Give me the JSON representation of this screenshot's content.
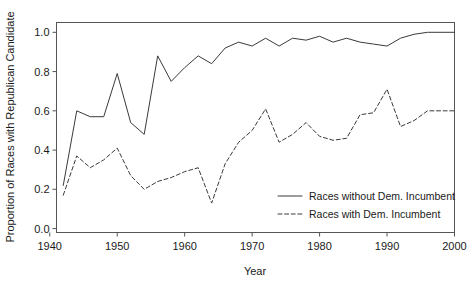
{
  "chart_data": {
    "type": "line",
    "title": "",
    "subtitle": "",
    "xlabel": "Year",
    "ylabel": "Proportion of Races with Republican Candidate",
    "xlim": [
      1941,
      2000
    ],
    "ylim": [
      -0.02,
      1.05
    ],
    "grid": false,
    "legend_position": "bottom-right",
    "xticks": [
      1940,
      1950,
      1960,
      1970,
      1980,
      1990,
      2000
    ],
    "xticklabels": [
      "1940",
      "1950",
      "1960",
      "1970",
      "1980",
      "1990",
      "2000"
    ],
    "yticks": [
      0.0,
      0.2,
      0.4,
      0.6,
      0.8,
      1.0
    ],
    "yticklabels": [
      "0.0",
      "0.2",
      "0.4",
      "0.6",
      "0.8",
      "1.0"
    ],
    "x": [
      1942,
      1944,
      1946,
      1948,
      1950,
      1952,
      1954,
      1956,
      1958,
      1960,
      1962,
      1964,
      1966,
      1968,
      1970,
      1972,
      1974,
      1976,
      1978,
      1980,
      1982,
      1984,
      1986,
      1988,
      1990,
      1992,
      1994,
      1996,
      1998,
      2000
    ],
    "series": [
      {
        "name": "Races without Dem. Incumbent",
        "style": "solid",
        "color": "#3a3a3a",
        "values": [
          0.22,
          0.6,
          0.57,
          0.57,
          0.79,
          0.54,
          0.48,
          0.88,
          0.75,
          0.82,
          0.88,
          0.84,
          0.92,
          0.95,
          0.93,
          0.97,
          0.93,
          0.97,
          0.96,
          0.98,
          0.95,
          0.97,
          0.95,
          0.94,
          0.93,
          0.97,
          0.99,
          1.0,
          1.0,
          1.0
        ]
      },
      {
        "name": "Races with Dem. Incumbent",
        "style": "dashed",
        "color": "#3a3a3a",
        "values": [
          0.17,
          0.37,
          0.31,
          0.35,
          0.41,
          0.27,
          0.2,
          0.24,
          0.26,
          0.29,
          0.31,
          0.13,
          0.33,
          0.44,
          0.5,
          0.61,
          0.44,
          0.48,
          0.54,
          0.47,
          0.45,
          0.46,
          0.58,
          0.59,
          0.71,
          0.52,
          0.55,
          0.6,
          0.6,
          0.6
        ]
      }
    ]
  },
  "axes": {
    "ylabel": "Proportion of Races with Republican Candidate",
    "xlabel": "Year"
  },
  "legend": {
    "entries": [
      {
        "label": "Races without Dem. Incumbent",
        "style": "solid"
      },
      {
        "label": "Races with Dem. Incumbent",
        "style": "dashed"
      }
    ]
  }
}
